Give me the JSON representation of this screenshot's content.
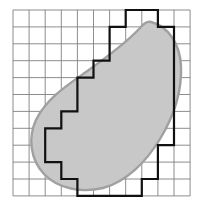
{
  "figure": {
    "colors": {
      "background": "#ffffff",
      "grid_line": "#808080",
      "blob_fill": "#c8c8c8",
      "blob_outline": "#a0a0a0",
      "staircase_outline": "#111111"
    },
    "grid": {
      "columns": 11,
      "rows": 11,
      "origin_x": 13,
      "origin_y": 10,
      "cell_width": 16.1,
      "cell_height": 16.9,
      "line_width": 0.9
    },
    "blob": {
      "fill_opacity": 1,
      "outline_width": 2.4,
      "path": "M 151 22 C 168 26 180 44 181 66 C 182 90 174 116 160 139 C 146 162 126 182 103 188 C 82 193 58 189 44 174 C 30 159 28 137 36 120 C 46 99 66 86 86 72 C 107 57 129 40 140 28 C 144 23 147 21 151 22 Z"
    },
    "staircase": {
      "stroke_width": 2.2,
      "covered_cells_by_row": [
        {
          "row": 0,
          "start_col": 7,
          "end_col": 8
        },
        {
          "row": 1,
          "start_col": 6,
          "end_col": 9
        },
        {
          "row": 2,
          "start_col": 6,
          "end_col": 9
        },
        {
          "row": 3,
          "start_col": 5,
          "end_col": 9
        },
        {
          "row": 4,
          "start_col": 4,
          "end_col": 9
        },
        {
          "row": 5,
          "start_col": 4,
          "end_col": 9
        },
        {
          "row": 6,
          "start_col": 3,
          "end_col": 9
        },
        {
          "row": 7,
          "start_col": 2,
          "end_col": 9
        },
        {
          "row": 8,
          "start_col": 2,
          "end_col": 8
        },
        {
          "row": 9,
          "start_col": 3,
          "end_col": 8
        },
        {
          "row": 10,
          "start_col": 4,
          "end_col": 7
        }
      ],
      "total_covered_cells": 62
    }
  }
}
